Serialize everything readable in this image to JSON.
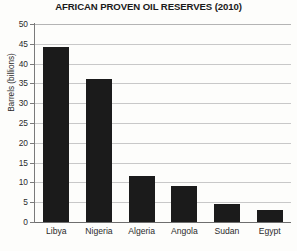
{
  "chart_data": {
    "type": "bar",
    "title": "AFRICAN PROVEN OIL RESERVES (2010)",
    "xlabel": "",
    "ylabel": "Barrels (billions)",
    "categories": [
      "Libya",
      "Nigeria",
      "Algeria",
      "Angola",
      "Sudan",
      "Egypt"
    ],
    "values": [
      44.3,
      36.2,
      11.5,
      9.2,
      4.5,
      3.0
    ],
    "ylim": [
      0,
      50
    ],
    "ytick_step": 5,
    "yticks": [
      0,
      5,
      10,
      15,
      20,
      25,
      30,
      35,
      40,
      45,
      50
    ],
    "ytick_labels": [
      "0",
      "5",
      "10",
      "15",
      "20",
      "25",
      "30",
      "35",
      "40",
      "45",
      "50"
    ],
    "grid": true,
    "grid_axis": "y",
    "legend": false,
    "legend_position": "none",
    "bar_color": "#1b1b1b",
    "gridline_color": "#c8c8c8",
    "axis_color": "#7a7a7a",
    "background_color": "#fdfdfb",
    "text_color": "#2b2b2b"
  }
}
